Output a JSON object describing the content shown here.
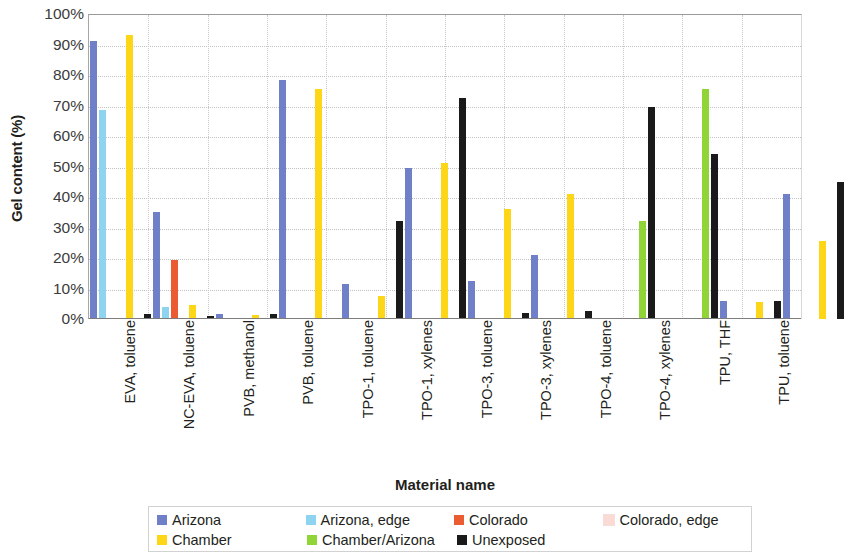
{
  "chart_data": {
    "type": "bar",
    "title": "",
    "xlabel": "Material name",
    "ylabel": "Gel content (%)",
    "ylim": [
      0,
      100
    ],
    "ytick_labels": [
      "100%",
      "90%",
      "80%",
      "70%",
      "60%",
      "50%",
      "40%",
      "30%",
      "20%",
      "10%",
      "0%"
    ],
    "ytick_values": [
      100,
      90,
      80,
      70,
      60,
      50,
      40,
      30,
      20,
      10,
      0
    ],
    "grid": true,
    "legend_position": "bottom",
    "categories": [
      "EVA, toluene",
      "NC-EVA, toluene",
      "PVB, methanol",
      "PVB, toluene",
      "TPO-1, toluene",
      "TPO-1, xylenes",
      "TPO-3, toluene",
      "TPO-3, xylenes",
      "TPO-4, toluene",
      "TPO-4, xylenes",
      "TPU, THF",
      "TPU, toluene"
    ],
    "series": [
      {
        "name": "Arizona",
        "color": "#6f7fc8",
        "values": [
          91,
          35,
          1.5,
          78.5,
          11.5,
          49.5,
          12.5,
          21,
          0,
          0,
          6,
          41
        ]
      },
      {
        "name": "Arizona, edge",
        "color": "#8ed3ef",
        "values": [
          68.5,
          4,
          0,
          0,
          0,
          0,
          0,
          0,
          0,
          0,
          0,
          0
        ]
      },
      {
        "name": "Colorado",
        "color": "#eb5c33",
        "values": [
          0,
          19.5,
          0,
          0,
          0,
          0,
          0,
          0,
          0,
          0,
          0,
          0
        ]
      },
      {
        "name": "Colorado, edge",
        "color": "#fbd9d4",
        "values": [
          0,
          0,
          0,
          0,
          0,
          0,
          0,
          0,
          0,
          0,
          0,
          0
        ]
      },
      {
        "name": "Chamber",
        "color": "#fcd617",
        "values": [
          93,
          4.5,
          1.2,
          75.5,
          7.5,
          51,
          36,
          41,
          0,
          0,
          5.5,
          25.5
        ]
      },
      {
        "name": "Chamber/Arizona",
        "color": "#90d437",
        "values": [
          0,
          0,
          0,
          0,
          0,
          0,
          0,
          0,
          32,
          75.5,
          0,
          0
        ]
      },
      {
        "name": "Unexposed",
        "color": "#1a1a1a",
        "values": [
          1.5,
          1,
          1.5,
          0,
          32,
          72.5,
          2,
          2.5,
          69.5,
          54,
          6,
          45
        ]
      }
    ]
  },
  "legend": {
    "row1": [
      {
        "label": "Arizona",
        "color": "#6f7fc8"
      },
      {
        "label": "Arizona, edge",
        "color": "#8ed3ef"
      },
      {
        "label": "Colorado",
        "color": "#eb5c33"
      },
      {
        "label": "Colorado, edge",
        "color": "#fbd9d4"
      }
    ],
    "row2": [
      {
        "label": "Chamber",
        "color": "#fcd617"
      },
      {
        "label": "Chamber/Arizona",
        "color": "#90d437"
      },
      {
        "label": "Unexposed",
        "color": "#1a1a1a"
      }
    ]
  }
}
